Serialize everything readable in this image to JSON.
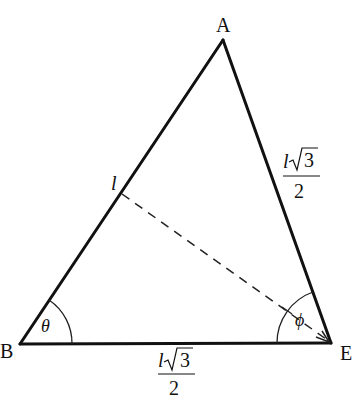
{
  "figure": {
    "type": "triangle-diagram",
    "vertices": {
      "A": {
        "label": "A",
        "x": 223,
        "y": 40
      },
      "B": {
        "label": "B",
        "x": 20,
        "y": 344
      },
      "E": {
        "label": "E",
        "x": 331,
        "y": 343
      }
    },
    "sides": {
      "AB": {
        "label_var": "l"
      },
      "AE": {
        "label_num_var": "l",
        "label_num_rad": "3",
        "label_den": "2"
      },
      "BE": {
        "label_num_var": "l",
        "label_num_rad": "3",
        "label_den": "2"
      }
    },
    "dashed_segment": {
      "from": {
        "x": 122,
        "y": 194
      },
      "to": {
        "x": 328,
        "y": 340
      },
      "arrow_at": "E"
    },
    "angles": {
      "B": {
        "symbol": "θ"
      },
      "E": {
        "symbol": "ϕ"
      }
    },
    "colors": {
      "stroke": "#111111",
      "background": "#ffffff"
    }
  }
}
